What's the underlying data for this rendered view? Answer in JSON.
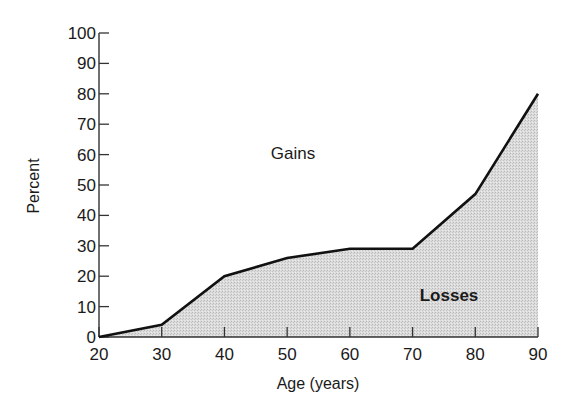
{
  "chart_data": {
    "type": "area",
    "title": "",
    "xlabel": "Age (years)",
    "ylabel": "Percent",
    "x": [
      20,
      30,
      40,
      50,
      60,
      70,
      80,
      90
    ],
    "series": [
      {
        "name": "Losses",
        "values": [
          0,
          4,
          20,
          26,
          29,
          29,
          47,
          80
        ]
      }
    ],
    "xlim": [
      20,
      90
    ],
    "ylim": [
      0,
      100
    ],
    "xticks": [
      20,
      30,
      40,
      50,
      60,
      70,
      80,
      90
    ],
    "yticks": [
      0,
      10,
      20,
      30,
      40,
      50,
      60,
      70,
      80,
      90,
      100
    ],
    "grid": false,
    "legend": "none",
    "annotations": [
      {
        "text": "Gains",
        "x": 52,
        "y": 60,
        "region": "above curve"
      },
      {
        "text": "Losses",
        "x": 82,
        "y": 14,
        "region": "below curve (shaded)"
      }
    ],
    "colors": {
      "fill": "#d6d6d6",
      "line": "#111111",
      "axis": "#333333"
    }
  },
  "labels": {
    "xlabel": "Age (years)",
    "ylabel": "Percent",
    "gains": "Gains",
    "losses": "Losses"
  }
}
